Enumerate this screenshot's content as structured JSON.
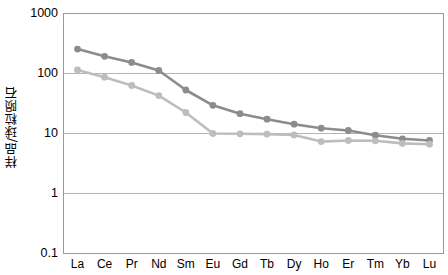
{
  "chart_data": {
    "type": "line",
    "title": "",
    "xlabel": "",
    "ylabel": "样品/球粒陨石",
    "categories": [
      "La",
      "Ce",
      "Pr",
      "Nd",
      "Sm",
      "Eu",
      "Gd",
      "Tb",
      "Dy",
      "Ho",
      "Er",
      "Tm",
      "Yb",
      "Lu"
    ],
    "yscale": "log",
    "ylim": [
      0.1,
      1000
    ],
    "ytick_labels": [
      "1000",
      "100",
      "10",
      "1",
      "0.1"
    ],
    "ytick_values": [
      1000,
      100,
      10,
      1,
      0.1
    ],
    "grid": true,
    "legend": "none",
    "series": [
      {
        "name": "series-1",
        "color": "#8c8c8c",
        "marker": "circle",
        "values": [
          250,
          190,
          150,
          110,
          52,
          29,
          21,
          17,
          14,
          12,
          11,
          9.2,
          8.0,
          7.5
        ]
      },
      {
        "name": "series-2",
        "color": "#bdbdbd",
        "marker": "circle",
        "values": [
          112,
          85,
          62,
          42,
          22,
          9.8,
          9.7,
          9.6,
          9.3,
          7.2,
          7.5,
          7.4,
          6.7,
          6.5
        ]
      }
    ]
  },
  "axes": {
    "y_title": "样品/球粒陨石"
  },
  "style": {
    "plot_border_color": "#9a9a9a",
    "gridline_color": "#b5b5b5",
    "background": "#ffffff"
  }
}
